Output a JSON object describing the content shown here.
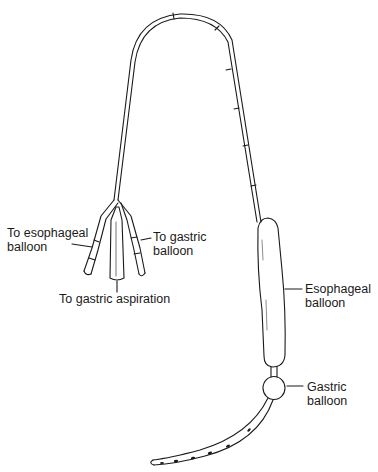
{
  "diagram": {
    "labels": {
      "esophageal_port": {
        "line1": "To esophageal",
        "line2": "balloon"
      },
      "gastric_port": {
        "line1": "To gastric",
        "line2": "balloon"
      },
      "aspiration_port": {
        "text": "To gastric aspiration"
      },
      "esophageal_balloon": {
        "line1": "Esophageal",
        "line2": "balloon"
      },
      "gastric_balloon": {
        "line1": "Gastric",
        "line2": "balloon"
      }
    },
    "colors": {
      "ink": "#1a1a1a",
      "background": "#ffffff"
    }
  }
}
